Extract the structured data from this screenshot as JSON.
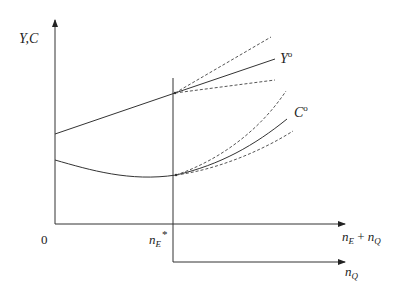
{
  "diagram": {
    "type": "economic-diagram",
    "axes": {
      "y_label": "Y,C",
      "origin_label": "0",
      "x_label_upper": {
        "base1": "n",
        "sub1": "E",
        "op": " + ",
        "base2": "n",
        "sub2": "Q"
      },
      "x_label_lower": {
        "base": "n",
        "sub": "Q"
      },
      "threshold_label": {
        "base": "n",
        "sub": "E",
        "sup": "*"
      }
    },
    "curves": {
      "Y": {
        "label": "Y",
        "superscript": "o"
      },
      "C": {
        "label": "C",
        "superscript": "o"
      }
    },
    "colors": {
      "line": "#333333",
      "dashed": "#555555",
      "text": "#222222"
    }
  }
}
